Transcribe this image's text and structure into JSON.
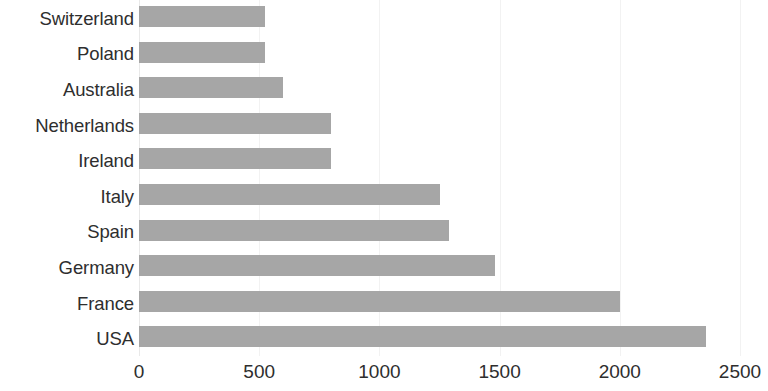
{
  "chart_data": {
    "type": "bar",
    "orientation": "horizontal",
    "title": "",
    "subtitle": "",
    "xlabel": "",
    "ylabel": "",
    "categories": [
      "Switzerland",
      "Poland",
      "Australia",
      "Netherlands",
      "Ireland",
      "Italy",
      "Spain",
      "Germany",
      "France",
      "USA"
    ],
    "values": [
      525,
      525,
      600,
      800,
      800,
      1250,
      1290,
      1480,
      2000,
      2360
    ],
    "series": [
      {
        "name": "",
        "values": [
          525,
          525,
          600,
          800,
          800,
          1250,
          1290,
          1480,
          2000,
          2360
        ],
        "color": "#a6a6a6"
      }
    ],
    "xlim": [
      0,
      2500
    ],
    "xticks": [
      0,
      500,
      1000,
      1500,
      2000,
      2500
    ],
    "xtick_labels": [
      "0",
      "500",
      "1000",
      "1500",
      "2000",
      "2500"
    ],
    "grid": true,
    "grid_axis": "x",
    "legend": false,
    "legend_position": "none",
    "bar_color": "#a6a6a6",
    "gridline_color": "#f2f2f2",
    "background_color": "#ffffff",
    "text_color": "#2e2e2e",
    "category_order": "bottom-to-top-descending"
  }
}
